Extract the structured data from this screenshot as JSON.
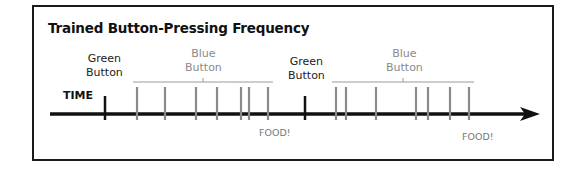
{
  "title": "Trained Button-Pressing Frequency",
  "axis_label": "TIME",
  "groups": [
    {
      "green_label_line1": "Green",
      "green_label_line2": "Button",
      "blue_label_line1": "Blue",
      "blue_label_line2": "Button",
      "food_label": "FOOD!",
      "green_press_x": 105,
      "blue_press_x": [
        137,
        165,
        196,
        217,
        241,
        249,
        268
      ],
      "bracket": [
        133,
        273
      ]
    },
    {
      "green_label_line1": "Green",
      "green_label_line2": "Button",
      "blue_label_line1": "Blue",
      "blue_label_line2": "Button",
      "food_label": "FOOD!",
      "green_press_x": 305,
      "blue_press_x": [
        336,
        346,
        376,
        416,
        428,
        450,
        469
      ],
      "bracket": [
        332,
        474
      ]
    }
  ],
  "colors": {
    "axis": "#111111",
    "green_press": "#111111",
    "blue_press": "#8a8a8a",
    "bracket": "#9a9a9a"
  }
}
